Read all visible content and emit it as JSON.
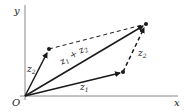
{
  "diagram": {
    "type": "vector-addition-parallelogram",
    "axes": {
      "x_label": "x",
      "y_label": "y",
      "origin_label": "O"
    },
    "points": {
      "origin": [
        25,
        96
      ],
      "z1_tip": [
        123,
        72
      ],
      "z2_tip": [
        49,
        49
      ],
      "sum_tip": [
        146,
        24
      ]
    },
    "vectors": [
      {
        "name": "z1",
        "label_base": "z",
        "label_sub": "1",
        "style": "solid"
      },
      {
        "name": "z2",
        "label_base": "z",
        "label_sub": "2",
        "style": "solid"
      },
      {
        "name": "z1+z2",
        "label_text": "z",
        "style": "solid"
      },
      {
        "name": "z2-translated",
        "label_base": "z",
        "label_sub": "2",
        "style": "dashed"
      }
    ],
    "sum_label": {
      "a": "z",
      "a_sub": "1",
      "plus": " + ",
      "b": "z",
      "b_sub": "2"
    },
    "colors": {
      "ink": "#1a1a1a",
      "axis": "#888888",
      "background": "#ffffff"
    }
  }
}
